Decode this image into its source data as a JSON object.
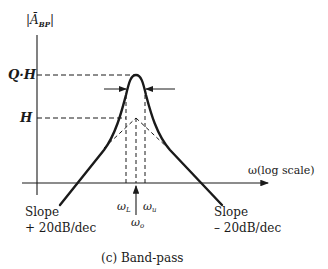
{
  "figure": {
    "caption": "(c)  Band-pass",
    "y_axis_label": "|Ā",
    "y_axis_label_sub": "BP",
    "y_axis_label_end": "|",
    "x_axis_label": "ω(log scale)",
    "levels": {
      "qh": "Q·H",
      "h": "H"
    },
    "frequencies": {
      "lower": "ω",
      "lower_sub": "L",
      "upper": "ω",
      "upper_sub": "u",
      "center": "ω",
      "center_sub": "o"
    },
    "left_slope": {
      "line1": "Slope",
      "line2": "+ 20dB/dec"
    },
    "right_slope": {
      "line1": "Slope",
      "line2": "– 20dB/dec"
    },
    "colors": {
      "ink": "#1a1a1a",
      "background": "#ffffff"
    }
  }
}
